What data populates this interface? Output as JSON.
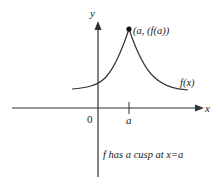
{
  "diagram": {
    "axes": {
      "x_label": "x",
      "y_label": "y",
      "origin_label": "0",
      "tick_label": "a"
    },
    "curve": {
      "label": "f(x)",
      "cusp_point_label": "(a, (f(a))"
    },
    "caption": "f has a cusp at x=a",
    "colors": {
      "stroke": "#333333",
      "text": "#222222",
      "background": "#ffffff"
    }
  }
}
